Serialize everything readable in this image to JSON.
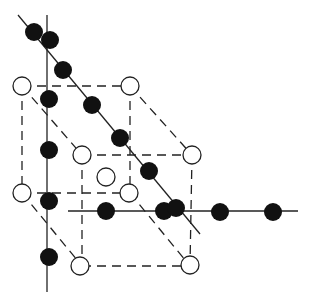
{
  "diagram": {
    "title": "",
    "colors": {
      "line": "#222222",
      "filled": "#111111",
      "open": "#ffffff",
      "background": "#ffffff"
    },
    "solid_lines": [
      {
        "x1": 47,
        "y1": 15,
        "x2": 47,
        "y2": 292
      },
      {
        "x1": 18,
        "y1": 15,
        "x2": 200,
        "y2": 234
      },
      {
        "x1": 68,
        "y1": 211,
        "x2": 298,
        "y2": 211
      }
    ],
    "dashed_lines": [
      {
        "x1": 22,
        "y1": 86,
        "x2": 130,
        "y2": 86
      },
      {
        "x1": 22,
        "y1": 86,
        "x2": 22,
        "y2": 193
      },
      {
        "x1": 130,
        "y1": 86,
        "x2": 130,
        "y2": 193
      },
      {
        "x1": 22,
        "y1": 193,
        "x2": 130,
        "y2": 193
      },
      {
        "x1": 82,
        "y1": 155,
        "x2": 192,
        "y2": 155
      },
      {
        "x1": 82,
        "y1": 155,
        "x2": 82,
        "y2": 266
      },
      {
        "x1": 192,
        "y1": 155,
        "x2": 190,
        "y2": 266
      },
      {
        "x1": 82,
        "y1": 266,
        "x2": 190,
        "y2": 266
      },
      {
        "x1": 22,
        "y1": 86,
        "x2": 82,
        "y2": 155
      },
      {
        "x1": 130,
        "y1": 86,
        "x2": 192,
        "y2": 155
      },
      {
        "x1": 22,
        "y1": 193,
        "x2": 82,
        "y2": 266
      },
      {
        "x1": 130,
        "y1": 193,
        "x2": 190,
        "y2": 266
      }
    ],
    "open_atoms": [
      {
        "cx": 22,
        "cy": 86
      },
      {
        "cx": 130,
        "cy": 86
      },
      {
        "cx": 82,
        "cy": 155
      },
      {
        "cx": 192,
        "cy": 155
      },
      {
        "cx": 106,
        "cy": 177
      },
      {
        "cx": 22,
        "cy": 193
      },
      {
        "cx": 129,
        "cy": 193
      },
      {
        "cx": 80,
        "cy": 266
      },
      {
        "cx": 190,
        "cy": 265
      }
    ],
    "filled_atoms": [
      {
        "cx": 34,
        "cy": 32
      },
      {
        "cx": 50,
        "cy": 40
      },
      {
        "cx": 63,
        "cy": 70
      },
      {
        "cx": 49,
        "cy": 99
      },
      {
        "cx": 92,
        "cy": 105
      },
      {
        "cx": 120,
        "cy": 138
      },
      {
        "cx": 49,
        "cy": 150
      },
      {
        "cx": 149,
        "cy": 171
      },
      {
        "cx": 49,
        "cy": 201
      },
      {
        "cx": 106,
        "cy": 211
      },
      {
        "cx": 164,
        "cy": 211
      },
      {
        "cx": 176,
        "cy": 208
      },
      {
        "cx": 220,
        "cy": 212
      },
      {
        "cx": 273,
        "cy": 212
      },
      {
        "cx": 49,
        "cy": 257
      }
    ],
    "atom_radius": 9
  }
}
